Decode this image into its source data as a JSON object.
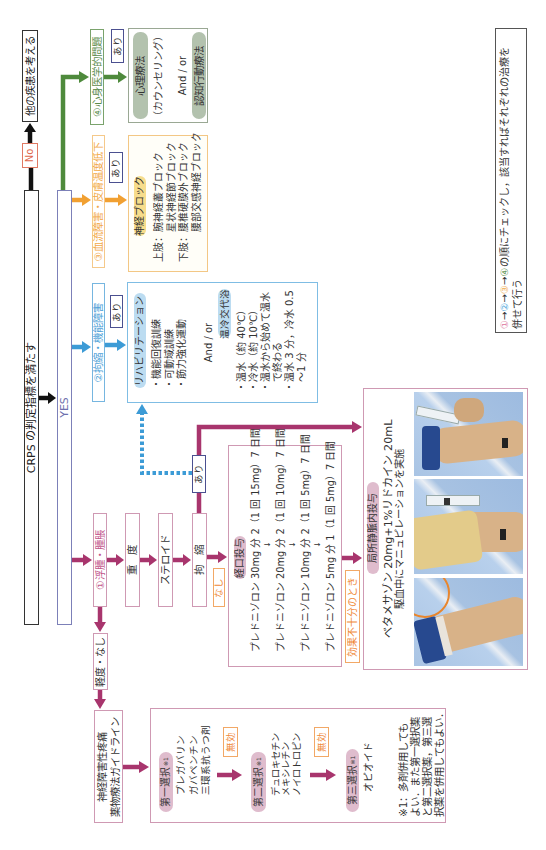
{
  "legend": {
    "steps": [
      "①",
      "②",
      "③",
      "④"
    ],
    "arrow": "→",
    "text": "の順にチェックし，該当すればそれぞれの治療を",
    "line2": "併せて行う"
  },
  "start": {
    "criteria": "CRPS の判定指標を満たす",
    "no_label": "No",
    "no_result": "他の疾患を考える",
    "yes_label": "YES"
  },
  "psych": {
    "condition": "④心身医学的問題",
    "present": "あり",
    "therapy1": "心理療法",
    "therapy1_note": "（カウンセリング）",
    "and_or": "And / or",
    "therapy2": "認知行動療法"
  },
  "circulation": {
    "condition": "③血流障害・皮膚温度低下",
    "present": "あり",
    "treatment": "神経ブロック",
    "rows": [
      {
        "limb": "上肢：",
        "block": "腕神経叢ブロック"
      },
      {
        "limb": "",
        "block": "星状神経節ブロック"
      },
      {
        "limb": "下肢：",
        "block": "腰椎硬膜外ブロック"
      },
      {
        "limb": "",
        "block": "腰部交感神経ブロック"
      }
    ]
  },
  "contracture": {
    "condition": "②拘縮・機能障害",
    "present": "あり",
    "rehab": "リハビリテーション",
    "rehab_items": [
      "・機能回復訓練",
      "・可動域訓練",
      "・筋力強化運動"
    ],
    "and_or": "And / or",
    "bath": "温冷交代浴",
    "bath_items": [
      "・温水（約 40℃）",
      "・冷水（約 10℃）",
      "・温水から始めて温水",
      "　で終わる",
      "・温水 3 分，冷水 0.5",
      "　～1 分"
    ]
  },
  "edema": {
    "condition": "①浮腫・腫脹",
    "severe": "重　度",
    "steroid": "ステロイド",
    "contracture": "拘　縮",
    "contracture_present": "あり",
    "contracture_absent": "なし",
    "mild_none": "軽度・なし"
  },
  "oral": {
    "title": "経口投与",
    "steps": [
      "プレドニゾロン 30mg 分 2（1 回 15mg）7 日間",
      "プレドニゾロン 20mg 分 2（1 回 10mg）7 日間",
      "プレドニゾロン 10mg 分 2（1 回 5mg）7 日間",
      "プレドニゾロン 5mg 分 1（1 回 5mg）7 日間"
    ],
    "step_arrow": "↓",
    "insufficient": "効果不十分のとき"
  },
  "ivra": {
    "title": "局所静脈内投与",
    "regimen": "ベタメサゾン 20mg+1%リドカイン 20mL",
    "note": "駆血中にマニュピレーションを実施"
  },
  "neuropathic": {
    "guideline_line1": "神経障害性疼痛",
    "guideline_line2": "薬物療法ガイドライン",
    "ineffective": "無効",
    "choices": [
      {
        "label": "第一選択",
        "note": "※1",
        "drugs": [
          "プレガバリン",
          "ガバペンチン",
          "三環系抗うつ剤"
        ]
      },
      {
        "label": "第二選択",
        "note": "※1",
        "drugs": [
          "デュロキセチン",
          "メキシレチン",
          "ノイロトロピン"
        ]
      },
      {
        "label": "第三選択",
        "note": "※1",
        "drugs": [
          "オピオイド"
        ]
      }
    ],
    "footnote": [
      "※1：多剤併用しても",
      "よい．また第一選択薬",
      "と第二選択薬，第三選",
      "択薬を併用してもよい．"
    ]
  },
  "colors": {
    "magenta": "#a8356d",
    "blue": "#3c9bd6",
    "orange": "#f1a032",
    "green": "#4e8a3c",
    "black": "#111111",
    "pink_pill": "#dfbccd",
    "blue_pill": "#bcdcf1",
    "yellow_pill": "#f7dd8c",
    "green_pill": "#b3c2ae"
  }
}
